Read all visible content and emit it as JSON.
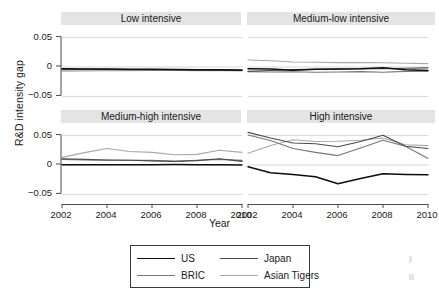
{
  "chart_data": {
    "type": "line",
    "title": "",
    "xlabel": "Year",
    "ylabel": "R&D intensity gap",
    "x": [
      2002,
      2003,
      2004,
      2005,
      2006,
      2007,
      2008,
      2009,
      2010
    ],
    "xticks": [
      "2002",
      "2004",
      "2006",
      "2008",
      "2010"
    ],
    "xtick_values": [
      2002,
      2004,
      2006,
      2008,
      2010
    ],
    "yticks": [
      "0.05",
      "0",
      "-0.05"
    ],
    "ytick_values": [
      0.05,
      0,
      -0.05
    ],
    "ylim": [
      -0.068,
      0.068
    ],
    "xlim": [
      2002,
      2010
    ],
    "grid": true,
    "legend_position": "bottom-center",
    "series_names": [
      "US",
      "Japan",
      "BRIC",
      "Asian Tigers"
    ],
    "series_colors": {
      "US": "#0d0d0d",
      "Japan": "#4a4a4a",
      "BRIC": "#777777",
      "Asian Tigers": "#a8a8a8"
    },
    "panels": [
      {
        "id": "low-intensive",
        "title": "Low intensive",
        "row": 0,
        "col": 0,
        "series": [
          {
            "name": "US",
            "values": [
              -0.003,
              -0.0032,
              -0.0035,
              -0.0038,
              -0.004,
              -0.0042,
              -0.0045,
              -0.0048,
              -0.005
            ]
          },
          {
            "name": "Japan",
            "values": [
              -0.0035,
              -0.0038,
              -0.004,
              -0.0042,
              -0.0045,
              -0.0048,
              -0.005,
              -0.0053,
              -0.0055
            ]
          },
          {
            "name": "BRIC",
            "values": [
              -0.0045,
              -0.0046,
              -0.0048,
              -0.005,
              -0.005,
              -0.0052,
              -0.0055,
              -0.0058,
              -0.006
            ]
          },
          {
            "name": "Asian Tigers",
            "values": [
              -0.007,
              -0.0068,
              -0.0065,
              -0.0062,
              -0.006,
              -0.006,
              -0.0062,
              -0.0065,
              -0.0068
            ]
          }
        ]
      },
      {
        "id": "medium-low-intensive",
        "title": "Medium-low intensive",
        "row": 0,
        "col": 1,
        "series": [
          {
            "name": "US",
            "values": [
              -0.003,
              -0.0035,
              -0.0055,
              -0.004,
              -0.0032,
              -0.0028,
              -0.0012,
              -0.0045,
              -0.006
            ]
          },
          {
            "name": "Japan",
            "values": [
              -0.0075,
              -0.006,
              -0.0045,
              -0.004,
              -0.0038,
              -0.003,
              -0.003,
              -0.002,
              -0.0015
            ]
          },
          {
            "name": "BRIC",
            "values": [
              -0.008,
              -0.0085,
              -0.008,
              -0.009,
              -0.0085,
              -0.0078,
              -0.009,
              -0.0075,
              -0.007
            ]
          },
          {
            "name": "Asian Tigers",
            "values": [
              0.012,
              0.0105,
              0.0085,
              0.008,
              0.0075,
              0.0075,
              0.0072,
              0.0065,
              0.0058
            ]
          }
        ]
      },
      {
        "id": "medium-high-intensive",
        "title": "Medium-high intensive",
        "row": 1,
        "col": 0,
        "series": [
          {
            "name": "US",
            "values": [
              0.0005,
              0.0004,
              0.0003,
              0.0005,
              0.0006,
              0.0008,
              0.0006,
              0.0005,
              0.0
            ]
          },
          {
            "name": "Japan",
            "values": [
              0.0105,
              0.0095,
              0.0085,
              0.008,
              0.007,
              0.0062,
              0.0075,
              0.0105,
              0.0062
            ]
          },
          {
            "name": "BRIC",
            "values": [
              0.0095,
              0.0085,
              0.008,
              0.0082,
              0.008,
              0.0065,
              0.008,
              0.0095,
              0.0078
            ]
          },
          {
            "name": "Asian Tigers",
            "values": [
              0.013,
              0.021,
              0.028,
              0.023,
              0.0215,
              0.0175,
              0.018,
              0.025,
              0.0215
            ]
          }
        ]
      },
      {
        "id": "high-intensive",
        "title": "High intensive",
        "row": 1,
        "col": 1,
        "series": [
          {
            "name": "US",
            "values": [
              -0.003,
              -0.013,
              -0.016,
              -0.02,
              -0.032,
              -0.023,
              -0.015,
              -0.016,
              -0.0165
            ]
          },
          {
            "name": "Japan",
            "values": [
              0.0555,
              0.046,
              0.0375,
              0.036,
              0.031,
              0.04,
              0.0505,
              0.032,
              0.028
            ]
          },
          {
            "name": "BRIC",
            "values": [
              0.051,
              0.0415,
              0.028,
              0.0215,
              0.016,
              0.029,
              0.042,
              0.032,
              0.011
            ]
          },
          {
            "name": "Asian Tigers",
            "values": [
              0.02,
              0.033,
              0.043,
              0.04,
              0.0405,
              0.042,
              0.046,
              0.0345,
              0.033
            ]
          }
        ]
      }
    ],
    "legend": [
      {
        "label": "US",
        "color": "#0d0d0d"
      },
      {
        "label": "Japan",
        "color": "#4a4a4a"
      },
      {
        "label": "BRIC",
        "color": "#777777"
      },
      {
        "label": "Asian Tigers",
        "color": "#a8a8a8"
      }
    ]
  }
}
